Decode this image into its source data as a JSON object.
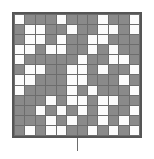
{
  "figure": {
    "type": "binary-grid",
    "rows": 12,
    "columns": 12,
    "colors": {
      "filled": "#8a8a8a",
      "empty": "#fbfbfb",
      "gridline": "#6d6d6d",
      "border": "#555555",
      "background": "#ffffff"
    },
    "tick": {
      "name": "center-bottom-tick",
      "orientation": "vertical"
    }
  },
  "chart_data": {
    "type": "heatmap",
    "title": "",
    "xlabel": "",
    "ylabel": "",
    "grid": true,
    "legend": "none",
    "categories_x": [
      "1",
      "2",
      "3",
      "4",
      "5",
      "6",
      "7",
      "8",
      "9",
      "10",
      "11",
      "12"
    ],
    "categories_y": [
      "1",
      "2",
      "3",
      "4",
      "5",
      "6",
      "7",
      "8",
      "9",
      "10",
      "11",
      "12"
    ],
    "value_labels": {
      "0": "empty",
      "1": "filled"
    },
    "values": [
      [
        0,
        1,
        1,
        1,
        0,
        1,
        1,
        1,
        0,
        1,
        1,
        0
      ],
      [
        1,
        0,
        0,
        1,
        1,
        0,
        1,
        1,
        0,
        0,
        1,
        0
      ],
      [
        1,
        0,
        0,
        1,
        0,
        1,
        1,
        0,
        0,
        1,
        1,
        1
      ],
      [
        0,
        0,
        1,
        0,
        0,
        1,
        1,
        0,
        1,
        0,
        1,
        1
      ],
      [
        0,
        1,
        1,
        1,
        1,
        1,
        0,
        1,
        1,
        0,
        0,
        1
      ],
      [
        1,
        0,
        0,
        1,
        1,
        0,
        0,
        1,
        0,
        1,
        1,
        0
      ],
      [
        0,
        0,
        1,
        1,
        1,
        0,
        0,
        1,
        1,
        1,
        0,
        1
      ],
      [
        0,
        1,
        1,
        1,
        1,
        0,
        1,
        0,
        1,
        1,
        1,
        0
      ],
      [
        1,
        1,
        1,
        0,
        1,
        0,
        0,
        1,
        0,
        0,
        1,
        1
      ],
      [
        1,
        1,
        0,
        1,
        0,
        1,
        0,
        1,
        0,
        1,
        1,
        0
      ],
      [
        1,
        1,
        1,
        0,
        1,
        0,
        1,
        1,
        0,
        1,
        0,
        1
      ],
      [
        1,
        0,
        1,
        0,
        0,
        1,
        1,
        0,
        1,
        0,
        1,
        0
      ]
    ]
  }
}
